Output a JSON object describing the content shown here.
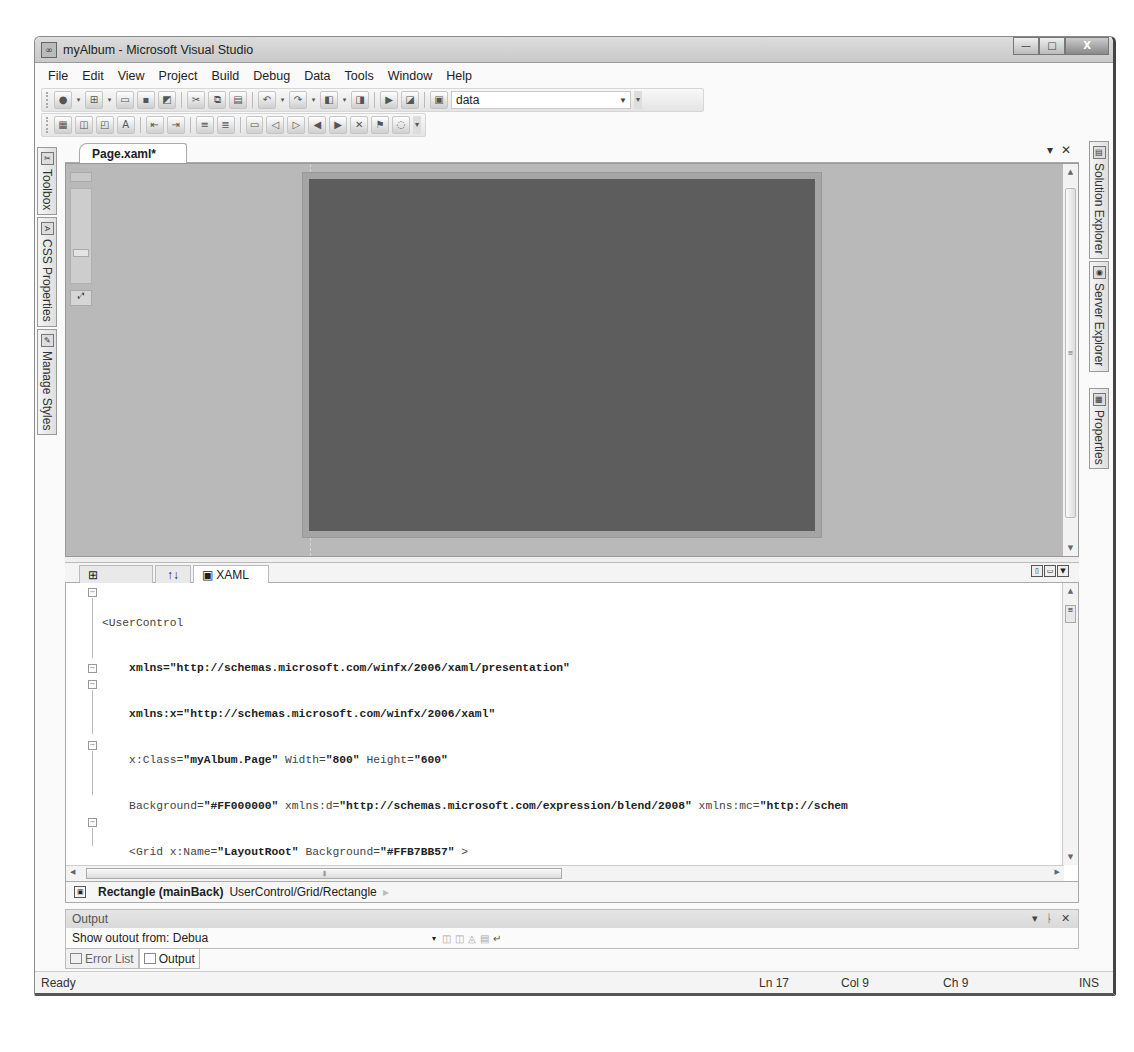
{
  "window": {
    "title": "myAlbum - Microsoft Visual Studio",
    "controls": {
      "minimize": "—",
      "maximize": "□",
      "close": "X"
    }
  },
  "menu": [
    "File",
    "Edit",
    "View",
    "Project",
    "Build",
    "Debug",
    "Data",
    "Tools",
    "Window",
    "Help"
  ],
  "toolbar": {
    "standard_icons": [
      "new-project-icon",
      "add-item-icon",
      "open-file-icon",
      "save-icon",
      "save-all-icon",
      "cut-icon",
      "copy-icon",
      "paste-icon",
      "undo-icon",
      "redo-icon",
      "navigate-back-icon",
      "navigate-forward-icon",
      "start-debugging-icon",
      "find-icon",
      "find-in-files-icon"
    ],
    "config_combo_value": "data",
    "layout_icons": [
      "align-icon",
      "bring-forward-icon",
      "send-backward-icon",
      "font-size-icon",
      "decrease-indent-icon",
      "increase-indent-icon",
      "comment-icon",
      "uncomment-icon",
      "bookmark-icon",
      "prev-bookmark-icon",
      "next-bookmark-icon",
      "prev-bookmark-folder-icon",
      "next-bookmark-folder-icon",
      "clear-bookmarks-icon",
      "toggle-bookmark-icon",
      "collapse-icon"
    ]
  },
  "left_sidebar": [
    {
      "label": "Toolbox",
      "icon": "toolbox-icon"
    },
    {
      "label": "CSS Properties",
      "icon": "css-properties-icon"
    },
    {
      "label": "Manage Styles",
      "icon": "manage-styles-icon"
    }
  ],
  "right_sidebar": [
    {
      "label": "Solution Explorer",
      "icon": "solution-explorer-icon"
    },
    {
      "label": "Server Explorer",
      "icon": "server-explorer-icon"
    },
    {
      "label": "Properties",
      "icon": "properties-icon"
    }
  ],
  "document": {
    "tab_label": "Page.xaml*",
    "tab_dropdown": "▾",
    "tab_close": "✕"
  },
  "designer": {
    "artboard_color": "#a5a5a5",
    "rectangle_color": "#5d5d5d",
    "surface_color": "#b9b9b9"
  },
  "view_tabs": {
    "preview": "Preview",
    "swap": "↑↓",
    "xaml": "XAML"
  },
  "code_lines": [
    {
      "indent": 0,
      "parts": [
        [
          "<UserControl",
          false
        ]
      ]
    },
    {
      "indent": 4,
      "parts": [
        [
          "xmlns=\"http://schemas.microsoft.com/winfx/2006/xaml/presentation\"",
          true
        ]
      ]
    },
    {
      "indent": 4,
      "parts": [
        [
          "xmlns:x=\"http://schemas.microsoft.com/winfx/2006/xaml\"",
          true
        ]
      ]
    },
    {
      "indent": 4,
      "parts": [
        [
          "x:Class=\"myAlbum.Page\" Width=\"800\" Height=\"600\"",
          false
        ]
      ]
    },
    {
      "indent": 4,
      "parts": [
        [
          "Background=\"#FF000000\" xmlns:d=\"http://schemas.microsoft.com/expression/blend/2008\" xmlns:mc=\"http://schem",
          false
        ]
      ]
    },
    {
      "indent": 4,
      "parts": [
        [
          "<Grid x:Name=\"LayoutRoot\" Background=\"#FFB7BB57\" >",
          false
        ]
      ]
    },
    {
      "indent": 8,
      "parts": [
        [
          "<Grid.ColumnDefinitions>",
          false
        ]
      ]
    },
    {
      "indent": 12,
      "parts": [
        [
          "<ColumnDefinition Width=\"128\" />",
          false
        ]
      ]
    },
    {
      "indent": 12,
      "parts": [
        [
          "<ColumnDefinition Width=\"*\" />",
          false
        ]
      ]
    },
    {
      "indent": 8,
      "parts": [
        [
          "</Grid.ColumnDefinitions>",
          false
        ]
      ]
    },
    {
      "indent": 8,
      "parts": [
        [
          "<Grid.RowDefinitions>",
          false
        ]
      ]
    },
    {
      "indent": 12,
      "parts": [
        [
          "<RowDefinition Height=\"*\"/>",
          false
        ]
      ]
    },
    {
      "indent": 12,
      "parts": [
        [
          "<RowDefinition Height=\"128\"/>",
          false
        ]
      ]
    },
    {
      "indent": 8,
      "parts": [
        [
          "</Grid.RowDefinitions>",
          false
        ]
      ]
    },
    {
      "indent": 0,
      "parts": [
        [
          "",
          false
        ]
      ]
    },
    {
      "indent": 8,
      "parts": [
        [
          "<Rectangle  x:Name=\"mainBack\" Grid.ColumnSpan=\"2\" Grid.RowSpan=\"2\" Margin=\"8,8,8,8\"  Fill=\"Red\"  >",
          false
        ]
      ]
    },
    {
      "indent": 8,
      "parts": [
        [
          "</Rectangle>",
          false
        ]
      ]
    }
  ],
  "code": {
    "l0": "<UserControl",
    "l1": "    xmlns=\"http://schemas.microsoft.com/winfx/2006/xaml/presentation\"",
    "l2": "    xmlns:x=\"http://schemas.microsoft.com/winfx/2006/xaml\"",
    "l3a": "    x:Class=",
    "l3b": "\"myAlbum.Page\"",
    "l3c": " Width=",
    "l3d": "\"800\"",
    "l3e": " Height=",
    "l3f": "\"600\"",
    "l4a": "    Background=",
    "l4b": "\"#FF000000\"",
    "l4c": " xmlns:d=",
    "l4d": "\"http://schemas.microsoft.com/expression/blend/2008\"",
    "l4e": " xmlns:mc=",
    "l4f": "\"http://schem",
    "l5a": "    <Grid x:Name=",
    "l5b": "\"LayoutRoot\"",
    "l5c": " Background=",
    "l5d": "\"#FFB7BB57\"",
    "l5e": " >",
    "l6": "        <Grid.ColumnDefinitions>",
    "l7a": "            <ColumnDefinition Width=",
    "l7b": "\"128\"",
    "l7c": " />",
    "l8a": "            <ColumnDefinition Width=",
    "l8b": "\"*\"",
    "l8c": " />",
    "l9": "        </Grid.ColumnDefinitions>",
    "l10": "        <Grid.RowDefinitions>",
    "l11a": "            <RowDefinition Height=",
    "l11b": "\"*\"",
    "l11c": "/>",
    "l12a": "            <RowDefinition Height=",
    "l12b": "\"128\"",
    "l12c": "/>",
    "l13": "        </Grid.RowDefinitions>",
    "l14": "",
    "l15a": "        <Rectangle  x:Name=",
    "l15b": "\"mainBack\"",
    "l15c": " Grid.ColumnSpan=",
    "l15d": "\"2\"",
    "l15e": " Grid.RowSpan=",
    "l15f": "\"2\"",
    "l15g": " Margin=",
    "l15h": "\"8,8,8,8\"",
    "l15i": "  Fill=",
    "l15j": "\"Red\"",
    "l15k": "  >",
    "l16": "        </Rectangle>"
  },
  "breadcrumb": {
    "element": "Rectangle (mainBack)",
    "path": "UserControl/Grid/Rectangle",
    "arrow": "▸"
  },
  "output_panel": {
    "title": "Output",
    "show_output_label": "Show outout from:  Debua",
    "controls": {
      "dropdown": "▾",
      "pin": "ᚿ",
      "close": "✕"
    }
  },
  "bottom_tabs": [
    {
      "label": "Error List",
      "icon": "error-list-icon",
      "active": false
    },
    {
      "label": "Output",
      "icon": "output-icon",
      "active": true
    }
  ],
  "statusbar": {
    "status": "Ready",
    "line": "Ln 17",
    "col": "Col 9",
    "ch": "Ch 9",
    "mode": "INS"
  }
}
